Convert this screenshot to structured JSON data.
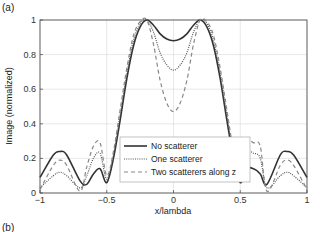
{
  "panel_labels": {
    "a": "(a)",
    "b": "(b)"
  },
  "chart_data": {
    "type": "line",
    "title": "",
    "xlabel": "x/lambda",
    "ylabel": "Image (normalized)",
    "xlim": [
      -1,
      1
    ],
    "ylim": [
      0,
      1
    ],
    "grid": true,
    "legend_position": "lower center",
    "xticks": [
      -1,
      -0.5,
      0,
      0.5,
      1
    ],
    "xtick_labels": [
      "-1",
      "-0.5",
      "0",
      "0.5",
      "1"
    ],
    "yticks": [
      0,
      0.2,
      0.4,
      0.6,
      0.8,
      1
    ],
    "ytick_labels": [
      "0",
      "0.2",
      "0.4",
      "0.6",
      "0.8",
      "1"
    ],
    "x": [
      -1.0,
      -0.9,
      -0.85,
      -0.8,
      -0.7,
      -0.65,
      -0.6,
      -0.55,
      -0.5,
      -0.45,
      -0.4,
      -0.35,
      -0.3,
      -0.25,
      -0.2,
      -0.15,
      -0.1,
      -0.05,
      0.0,
      0.05,
      0.1,
      0.15,
      0.2,
      0.25,
      0.3,
      0.35,
      0.4,
      0.45,
      0.5,
      0.55,
      0.6,
      0.65,
      0.7,
      0.8,
      0.85,
      0.9,
      1.0
    ],
    "series": [
      {
        "name": "No scatterer",
        "style": "solid",
        "color": "#333333",
        "values": [
          0.09,
          0.22,
          0.24,
          0.22,
          0.07,
          0.05,
          0.11,
          0.14,
          0.06,
          0.2,
          0.42,
          0.66,
          0.85,
          0.96,
          1.0,
          0.97,
          0.92,
          0.89,
          0.88,
          0.89,
          0.92,
          0.97,
          1.0,
          0.96,
          0.85,
          0.66,
          0.42,
          0.2,
          0.06,
          0.14,
          0.14,
          0.11,
          0.05,
          0.22,
          0.24,
          0.22,
          0.09
        ]
      },
      {
        "name": "One scatterer",
        "style": "dotted",
        "color": "#555555",
        "values": [
          0.03,
          0.1,
          0.12,
          0.1,
          0.03,
          0.1,
          0.2,
          0.23,
          0.08,
          0.22,
          0.45,
          0.69,
          0.88,
          0.98,
          1.0,
          0.93,
          0.81,
          0.74,
          0.71,
          0.74,
          0.81,
          0.93,
          1.0,
          0.98,
          0.88,
          0.69,
          0.45,
          0.22,
          0.08,
          0.23,
          0.23,
          0.2,
          0.03,
          0.1,
          0.12,
          0.1,
          0.03
        ]
      },
      {
        "name": "Two scatterers along z",
        "style": "dashed",
        "color": "#888888",
        "values": [
          0.02,
          0.16,
          0.19,
          0.16,
          0.01,
          0.15,
          0.27,
          0.29,
          0.1,
          0.24,
          0.48,
          0.72,
          0.91,
          0.99,
          1.0,
          0.86,
          0.65,
          0.52,
          0.47,
          0.52,
          0.65,
          0.86,
          1.0,
          0.99,
          0.91,
          0.72,
          0.48,
          0.24,
          0.1,
          0.29,
          0.29,
          0.27,
          0.01,
          0.16,
          0.19,
          0.16,
          0.02
        ]
      }
    ]
  }
}
